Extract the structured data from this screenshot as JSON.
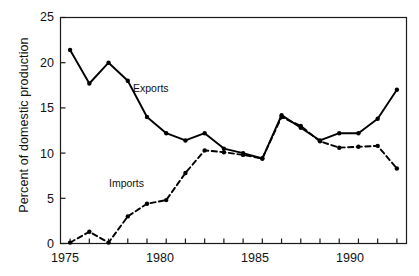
{
  "chart_data": {
    "type": "line",
    "title": "",
    "xlabel": "",
    "ylabel": "Percent of domestic production",
    "xlim": [
      1974.5,
      1992.5
    ],
    "ylim": [
      0,
      25
    ],
    "grid": false,
    "legend_position": "inline-annotation",
    "x": [
      1975,
      1976,
      1977,
      1978,
      1979,
      1980,
      1981,
      1982,
      1983,
      1984,
      1985,
      1986,
      1987,
      1988,
      1989,
      1990,
      1991,
      1992
    ],
    "xtick_labels": [
      "1975",
      "1980",
      "1985",
      "1990"
    ],
    "xtick_values": [
      1975,
      1980,
      1985,
      1990
    ],
    "ytick_labels": [
      "0",
      "5",
      "10",
      "15",
      "20",
      "25"
    ],
    "ytick_values": [
      0,
      5,
      10,
      15,
      20,
      25
    ],
    "series": [
      {
        "name": "Exports",
        "style": "solid",
        "marker": "filled-circle",
        "color": "#000000",
        "values": [
          21.4,
          17.7,
          20.0,
          18.0,
          14.0,
          12.2,
          11.4,
          12.2,
          10.5,
          10.0,
          9.4,
          14.2,
          12.8,
          11.4,
          12.2,
          12.2,
          13.8,
          17.0
        ]
      },
      {
        "name": "Imports",
        "style": "dashed",
        "marker": "filled-circle",
        "color": "#000000",
        "values": [
          0.1,
          1.3,
          0.1,
          3.0,
          4.4,
          4.8,
          7.8,
          10.3,
          10.1,
          9.8,
          9.4,
          14.0,
          13.0,
          11.3,
          10.6,
          10.7,
          10.8,
          8.3
        ]
      }
    ],
    "annotations": [
      {
        "text": "Exports",
        "x": 1978.6,
        "y": 16.6
      },
      {
        "text": "Imports",
        "x": 1977.6,
        "y": 6.9
      }
    ]
  },
  "axes": {
    "frame_color": "#1a1a1a",
    "line_color": "#000000"
  }
}
